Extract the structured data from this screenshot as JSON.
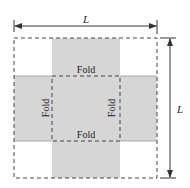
{
  "diagram": {
    "type": "net-of-open-box",
    "colors": {
      "fill": "#d6d6d6",
      "line": "#333333",
      "background": "#ffffff"
    },
    "dimensions": {
      "width_label": "L",
      "height_label": "L"
    },
    "fold_labels": {
      "top": "Fold",
      "bottom": "Fold",
      "left": "Fold",
      "right": "Fold"
    }
  }
}
